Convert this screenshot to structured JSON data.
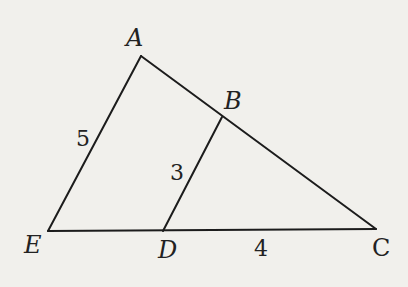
{
  "figure": {
    "background": "#f1f0ec",
    "line_color": "#1c1c1c",
    "points": {
      "A": {
        "label": "A",
        "x": 141,
        "y": 56
      },
      "B": {
        "label": "B",
        "x": 222,
        "y": 117
      },
      "C": {
        "label": "C",
        "x": 376,
        "y": 229
      },
      "D": {
        "label": "D",
        "x": 163,
        "y": 231
      },
      "E": {
        "label": "E",
        "x": 48,
        "y": 231
      }
    },
    "segments": [
      {
        "name": "AE",
        "from": "A",
        "to": "E"
      },
      {
        "name": "AC",
        "from": "A",
        "to": "C"
      },
      {
        "name": "EC",
        "from": "E",
        "to": "C"
      },
      {
        "name": "BD",
        "from": "B",
        "to": "D"
      }
    ],
    "measures": {
      "AE": "5",
      "BD": "3",
      "DC": "4"
    }
  }
}
